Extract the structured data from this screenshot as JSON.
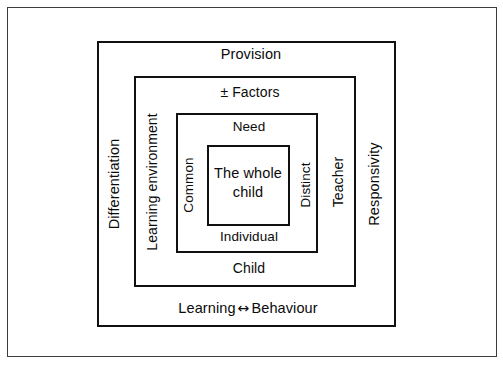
{
  "diagram": {
    "background_color": "#ffffff",
    "line_color": "#111111",
    "outer_frame_color": "#3c3c3c",
    "text_color": "#0b0b0b",
    "levels": [
      {
        "id": "outer-frame",
        "name": "outer-frame",
        "labels": {}
      },
      {
        "id": "level-1",
        "name": "provision-differentiation-level",
        "labels": {
          "top": "Provision",
          "left": "Differentiation",
          "right": "Responsivity",
          "bottom_left_word": "Learning",
          "bottom_arrow": "↔",
          "bottom_right_word": "Behaviour"
        }
      },
      {
        "id": "level-2",
        "name": "factors-learning-environment-level",
        "labels": {
          "top": "± Factors",
          "left": "Learning environment",
          "right": "Teacher",
          "bottom": "Child"
        }
      },
      {
        "id": "level-3",
        "name": "need-common-distinct-level",
        "labels": {
          "top": "Need",
          "left": "Common",
          "right": "Distinct",
          "bottom": "Individual"
        }
      },
      {
        "id": "level-4",
        "name": "core-level",
        "labels": {
          "core": "The whole child"
        }
      }
    ]
  }
}
